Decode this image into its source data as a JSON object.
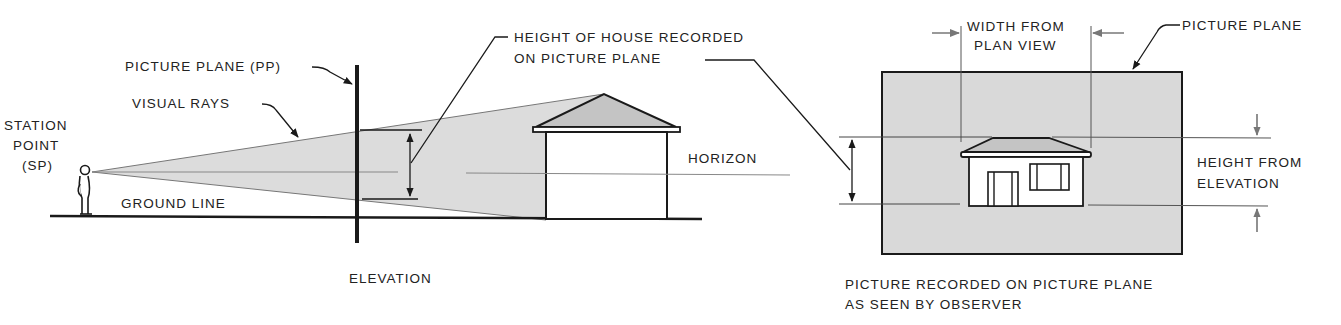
{
  "elevation": {
    "caption": "ELEVATION",
    "labels": {
      "station_point_line1": "STATION",
      "station_point_line2": "POINT",
      "station_point_line3": "(SP)",
      "picture_plane": "PICTURE PLANE (PP)",
      "visual_rays": "VISUAL RAYS",
      "ground_line": "GROUND LINE",
      "horizon": "HORIZON",
      "height_recorded_line1": "HEIGHT OF HOUSE RECORDED",
      "height_recorded_line2": "ON PICTURE PLANE"
    }
  },
  "picture": {
    "caption_line1": "PICTURE RECORDED ON PICTURE PLANE",
    "caption_line2": "AS SEEN BY OBSERVER",
    "labels": {
      "width_line1": "WIDTH FROM",
      "width_line2": "PLAN VIEW",
      "picture_plane": "PICTURE PLANE",
      "height_line1": "HEIGHT FROM",
      "height_line2": "ELEVATION"
    }
  },
  "colors": {
    "ink": "#1a1a1a",
    "shade": "#d9d9d9",
    "roof": "#bdbdbd",
    "thin": "#555555"
  }
}
